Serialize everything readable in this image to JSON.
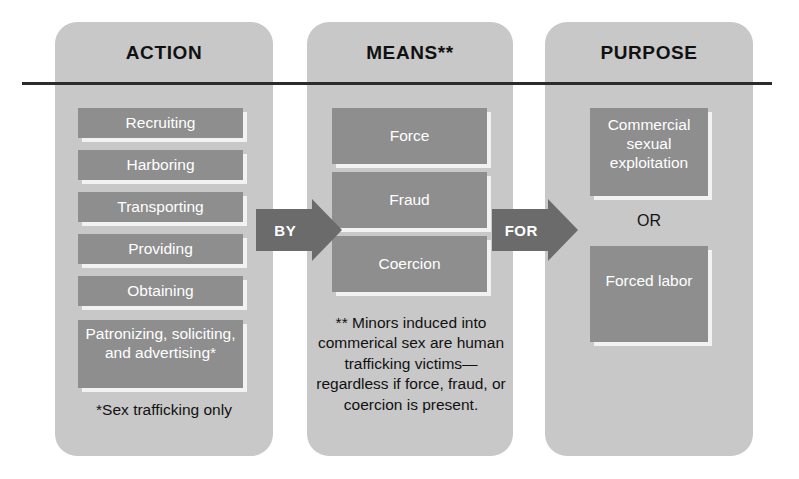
{
  "diagram": {
    "rule_color": "#2b2b2b",
    "panel_color": "#c8c8c8",
    "box_color": "#8e8e8e",
    "arrow_color": "#6b6b6b"
  },
  "columns": [
    {
      "id": "action",
      "header": "ACTION",
      "items": [
        {
          "label": "Recruiting"
        },
        {
          "label": "Harboring"
        },
        {
          "label": "Transporting"
        },
        {
          "label": "Providing"
        },
        {
          "label": "Obtaining"
        },
        {
          "label": "Patronizing, soliciting, and advertising*"
        }
      ],
      "footnote": "*Sex trafficking only"
    },
    {
      "id": "means",
      "header": "MEANS**",
      "items": [
        {
          "label": "Force"
        },
        {
          "label": "Fraud"
        },
        {
          "label": "Coercion"
        }
      ],
      "footnote": "** Minors induced into commerical sex are human trafficking victims—regardless if force, fraud, or coercion is present."
    },
    {
      "id": "purpose",
      "header": "PURPOSE",
      "items": [
        {
          "label": "Commercial sexual exploitation"
        },
        {
          "label": "Forced labor"
        }
      ],
      "separator": "OR",
      "footnote": ""
    }
  ],
  "connectors": [
    {
      "id": "by",
      "label": "BY"
    },
    {
      "id": "for",
      "label": "FOR"
    }
  ]
}
